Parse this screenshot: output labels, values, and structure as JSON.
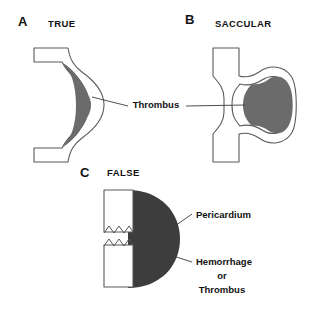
{
  "figure": {
    "type": "medical-illustration",
    "background_color": "#ffffff"
  },
  "colors": {
    "thrombus_gray": "#6b6b6b",
    "mass_dark": "#3d3d3d",
    "outline": "#5a5a5a",
    "text": "#111111",
    "leader": "#3a3a3a"
  },
  "panels": [
    {
      "letter": "A",
      "title": "TRUE",
      "letter_pos": {
        "x": 18,
        "y": 26
      },
      "title_pos": {
        "x": 48,
        "y": 27
      }
    },
    {
      "letter": "B",
      "title": "SACCULAR",
      "letter_pos": {
        "x": 185,
        "y": 24
      },
      "title_pos": {
        "x": 215,
        "y": 27
      }
    },
    {
      "letter": "C",
      "title": "FALSE",
      "letter_pos": {
        "x": 80,
        "y": 177
      },
      "title_pos": {
        "x": 107,
        "y": 176
      }
    }
  ],
  "callouts": [
    {
      "id": "thrombus",
      "text": "Thrombus",
      "x": 156,
      "y": 108,
      "anchor": "middle",
      "points_to": [
        "panel-a-sac",
        "panel-b-sac"
      ]
    },
    {
      "id": "pericardium",
      "text": "Pericardium",
      "x": 196,
      "y": 218,
      "anchor": "start",
      "points_to": [
        "panel-c-mass"
      ]
    },
    {
      "id": "hemorrhage",
      "text": "Hemorrhage",
      "x": 196,
      "y": 265,
      "anchor": "start",
      "points_to": [
        "panel-c-mass"
      ]
    },
    {
      "id": "or",
      "text": "or",
      "x": 222,
      "y": 279,
      "anchor": "middle",
      "points_to": []
    },
    {
      "id": "thrombus_c",
      "text": "Thrombus",
      "x": 222,
      "y": 293,
      "anchor": "middle",
      "points_to": []
    }
  ]
}
